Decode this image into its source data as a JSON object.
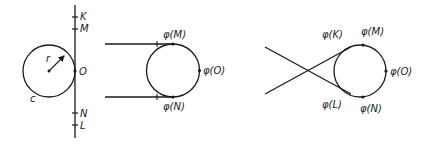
{
  "colors": {
    "stroke": "#1a1a1a",
    "background": "#ffffff"
  },
  "panel1": {
    "point_labels": {
      "K": "K",
      "M": "M",
      "O": "O",
      "N": "N",
      "L": "L"
    },
    "circle_label": "c",
    "radius_label": "r"
  },
  "panel2": {
    "labels": {
      "M": "φ(M)",
      "O": "φ(O)",
      "N": "φ(N)"
    }
  },
  "panel3": {
    "labels": {
      "K": "φ(K)",
      "M": "φ(M)",
      "O": "φ(O)",
      "L": "φ(L)",
      "N": "φ(N)"
    }
  }
}
